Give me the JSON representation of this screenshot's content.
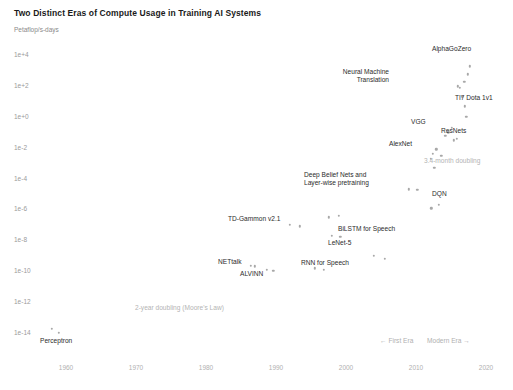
{
  "chart_data": {
    "type": "scatter",
    "title": "Two Distinct Eras of Compute Usage in Training AI Systems",
    "xlabel": "",
    "ylabel": "Petaflop/s-days",
    "yscale": "log",
    "grid": false,
    "legend": "none",
    "xlim": [
      1956,
      2022
    ],
    "ylim": [
      1e-15,
      100000.0
    ],
    "xticks": [
      "1960",
      "1970",
      "1980",
      "1990",
      "2000",
      "2010",
      "2020"
    ],
    "xtick_values": [
      1960,
      1970,
      1980,
      1990,
      2000,
      2010,
      2020
    ],
    "yticks": [
      "1e+4",
      "1e+2",
      "1e+0",
      "1e-2",
      "1e-4",
      "1e-6",
      "1e-8",
      "1e-10",
      "1e-12",
      "1e-14"
    ],
    "ytick_values": [
      10000,
      100,
      1,
      0.01,
      0.0001,
      1e-06,
      1e-08,
      1e-10,
      1e-12,
      1e-14
    ],
    "points": [
      {
        "label": "Perceptron",
        "x": 1958.0,
        "y": 1.8e-14,
        "lx": 40,
        "ly": 337,
        "align": "left"
      },
      {
        "label": "NETtalk",
        "x": 1987.0,
        "y": 2e-10,
        "lx": 218,
        "ly": 258,
        "align": "left"
      },
      {
        "label": "ALVINN",
        "x": 1988.7,
        "y": 1.2e-10,
        "lx": 240,
        "ly": 270,
        "align": "left"
      },
      {
        "label": "TD-Gammon v2.1",
        "x": 1992.0,
        "y": 1e-07,
        "lx": 228,
        "ly": 215,
        "align": "left"
      },
      {
        "label": "RNN for Speech",
        "x": 1995.5,
        "y": 1.5e-10,
        "lx": 301,
        "ly": 259,
        "align": "left"
      },
      {
        "label": "LeNet-5",
        "x": 1998.0,
        "y": 2e-08,
        "lx": 328,
        "ly": 239,
        "align": "left"
      },
      {
        "label": "BiLSTM for Speech",
        "x": 1997.5,
        "y": 3e-07,
        "lx": 338,
        "ly": 225,
        "align": "left"
      },
      {
        "label": "Deep Belief Nets and\nLayer-wise pretraining",
        "x": 2009.0,
        "y": 2e-05,
        "lx": 304,
        "ly": 171,
        "align": "left"
      },
      {
        "label": "DQN",
        "x": 2013.3,
        "y": 2e-06,
        "lx": 432,
        "ly": 190,
        "align": "left"
      },
      {
        "label": "AlexNet",
        "x": 2012.4,
        "y": 0.004,
        "lx": 389,
        "ly": 140,
        "align": "left"
      },
      {
        "label": "VGG",
        "x": 2014.2,
        "y": 0.06,
        "lx": 411,
        "ly": 118,
        "align": "left"
      },
      {
        "label": "ResNets",
        "x": 2015.4,
        "y": 0.03,
        "lx": 441,
        "ly": 127,
        "align": "left"
      },
      {
        "label": "Neural Machine\nTranslation",
        "x": 2016.0,
        "y": 100.0,
        "lx": 389,
        "ly": 68,
        "align": "right"
      },
      {
        "label": "TI7 Dota 1v1",
        "x": 2017.2,
        "y": 1.0,
        "lx": 455,
        "ly": 94,
        "align": "left"
      },
      {
        "label": "AlphaGoZero",
        "x": 2017.7,
        "y": 2000.0,
        "lx": 432,
        "ly": 45,
        "align": "left"
      }
    ],
    "extra_points": [
      {
        "x": 1959.0,
        "y": 1e-14
      },
      {
        "x": 1986.4,
        "y": 2.2e-10
      },
      {
        "x": 1989.6,
        "y": 1e-10
      },
      {
        "x": 1993.4,
        "y": 8e-08
      },
      {
        "x": 1996.8,
        "y": 1.2e-10
      },
      {
        "x": 1999.2,
        "y": 1.6e-08
      },
      {
        "x": 1999.0,
        "y": 4e-07
      },
      {
        "x": 2004.0,
        "y": 1e-09
      },
      {
        "x": 2005.5,
        "y": 6e-10
      },
      {
        "x": 2010.2,
        "y": 1.8e-05
      },
      {
        "x": 2012.1,
        "y": 0.002
      },
      {
        "x": 2012.6,
        "y": 0.0005
      },
      {
        "x": 2012.9,
        "y": 0.008
      },
      {
        "x": 2013.6,
        "y": 0.003
      },
      {
        "x": 2012.2,
        "y": 1.2e-06
      },
      {
        "x": 2014.6,
        "y": 0.1
      },
      {
        "x": 2015.1,
        "y": 0.2
      },
      {
        "x": 2015.8,
        "y": 0.04
      },
      {
        "x": 2016.3,
        "y": 80.0
      },
      {
        "x": 2016.6,
        "y": 20.0
      },
      {
        "x": 2017.0,
        "y": 5.0
      },
      {
        "x": 2017.4,
        "y": 600.0
      },
      {
        "x": 2016.9,
        "y": 200.0
      }
    ],
    "annotations": [
      {
        "text": "3.4-month doubling",
        "lx": 424,
        "ly": 157
      },
      {
        "text": "2-year doubling (Moore's Law)",
        "lx": 135,
        "ly": 304
      }
    ],
    "era_labels": [
      {
        "text": "← First Era",
        "lx": 380,
        "ly": 337
      },
      {
        "text": "Modern Era →",
        "lx": 427,
        "ly": 337
      }
    ],
    "colors": {
      "background": "#ffffff",
      "marker": "#a8a8a8",
      "title": "#1a1a1a",
      "tick": "#b0b0b0",
      "annotation": "#b4b4b4",
      "point_label": "#2b2b2b"
    }
  }
}
